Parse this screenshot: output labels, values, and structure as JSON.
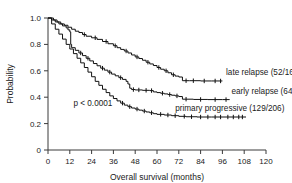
{
  "chart_data": {
    "type": "line",
    "title": "",
    "xlabel": "Overall survival (months)",
    "ylabel": "Probability",
    "xlim": [
      0,
      120
    ],
    "ylim": [
      0,
      1.0
    ],
    "xticks": [
      0,
      12,
      24,
      36,
      48,
      60,
      72,
      84,
      96,
      108,
      120
    ],
    "xtick_labels": [
      "0",
      "12",
      "24",
      "36",
      "48",
      "60",
      "72",
      "84",
      "96",
      "108",
      "120"
    ],
    "yticks": [
      0,
      0.2,
      0.4,
      0.6,
      0.8,
      1.0
    ],
    "ytick_labels": [
      "0",
      "0.2",
      "0.4",
      "0.6",
      "0.8",
      "1.0"
    ],
    "grid": false,
    "legend_position": "inline-right-of-curves",
    "annotations": [
      {
        "name": "p-value",
        "text": "p < 0.0001",
        "x": 14,
        "y": 0.33
      }
    ],
    "series": [
      {
        "name": "late relapse",
        "label": "late relapse (52/169)",
        "events": 52,
        "total": 169,
        "color": "#111111",
        "label_x": 98,
        "label_y": 0.565,
        "points": [
          [
            0,
            1.0
          ],
          [
            3,
            0.985
          ],
          [
            5,
            0.97
          ],
          [
            7,
            0.955
          ],
          [
            9,
            0.945
          ],
          [
            11,
            0.93
          ],
          [
            13,
            0.915
          ],
          [
            15,
            0.9
          ],
          [
            17,
            0.89
          ],
          [
            19,
            0.875
          ],
          [
            21,
            0.862
          ],
          [
            24,
            0.85
          ],
          [
            27,
            0.838
          ],
          [
            30,
            0.822
          ],
          [
            33,
            0.805
          ],
          [
            36,
            0.79
          ],
          [
            38,
            0.775
          ],
          [
            40,
            0.762
          ],
          [
            42,
            0.75
          ],
          [
            44,
            0.735
          ],
          [
            46,
            0.72
          ],
          [
            48,
            0.705
          ],
          [
            50,
            0.693
          ],
          [
            52,
            0.68
          ],
          [
            54,
            0.665
          ],
          [
            56,
            0.652
          ],
          [
            58,
            0.64
          ],
          [
            60,
            0.625
          ],
          [
            62,
            0.612
          ],
          [
            64,
            0.6
          ],
          [
            66,
            0.585
          ],
          [
            68,
            0.57
          ],
          [
            70,
            0.56
          ],
          [
            72,
            0.553
          ],
          [
            74,
            0.525
          ],
          [
            78,
            0.525
          ],
          [
            84,
            0.523
          ],
          [
            90,
            0.523
          ],
          [
            96,
            0.523
          ]
        ],
        "censor_times": [
          20,
          26,
          32,
          37,
          43,
          49,
          55,
          61,
          65,
          69,
          76,
          80,
          86,
          92,
          95
        ]
      },
      {
        "name": "early relapse",
        "label": "early relapse (64/138)",
        "events": 64,
        "total": 138,
        "color": "#111111",
        "label_x": 101,
        "label_y": 0.425,
        "points": [
          [
            0,
            1.0
          ],
          [
            2,
            0.985
          ],
          [
            4,
            0.97
          ],
          [
            6,
            0.955
          ],
          [
            8,
            0.94
          ],
          [
            10,
            0.925
          ],
          [
            11,
            0.91
          ],
          [
            12,
            0.895
          ],
          [
            12.5,
            0.8
          ],
          [
            13,
            0.775
          ],
          [
            15,
            0.755
          ],
          [
            17,
            0.735
          ],
          [
            19,
            0.715
          ],
          [
            21,
            0.695
          ],
          [
            23,
            0.675
          ],
          [
            25,
            0.655
          ],
          [
            27,
            0.638
          ],
          [
            29,
            0.62
          ],
          [
            31,
            0.605
          ],
          [
            33,
            0.59
          ],
          [
            35,
            0.575
          ],
          [
            37,
            0.562
          ],
          [
            39,
            0.548
          ],
          [
            41,
            0.535
          ],
          [
            43,
            0.52
          ],
          [
            44,
            0.5
          ],
          [
            45,
            0.468
          ],
          [
            46,
            0.458
          ],
          [
            48,
            0.455
          ],
          [
            52,
            0.452
          ],
          [
            56,
            0.45
          ],
          [
            58,
            0.44
          ],
          [
            60,
            0.435
          ],
          [
            62,
            0.43
          ],
          [
            64,
            0.425
          ],
          [
            66,
            0.42
          ],
          [
            68,
            0.415
          ],
          [
            70,
            0.41
          ],
          [
            72,
            0.405
          ],
          [
            74,
            0.385
          ],
          [
            80,
            0.383
          ],
          [
            88,
            0.382
          ],
          [
            96,
            0.382
          ],
          [
            100,
            0.382
          ]
        ],
        "censor_times": [
          18,
          22,
          30,
          34,
          40,
          47,
          50,
          54,
          57,
          63,
          67,
          71,
          76,
          84,
          92,
          98
        ]
      },
      {
        "name": "primary progressive",
        "label": "primary progressive (129/206)",
        "events": 129,
        "total": 206,
        "color": "#111111",
        "label_x": 70,
        "label_y": 0.295,
        "points": [
          [
            0,
            1.0
          ],
          [
            2,
            0.955
          ],
          [
            4,
            0.915
          ],
          [
            6,
            0.878
          ],
          [
            8,
            0.84
          ],
          [
            10,
            0.8
          ],
          [
            12,
            0.765
          ],
          [
            14,
            0.73
          ],
          [
            16,
            0.695
          ],
          [
            18,
            0.66
          ],
          [
            20,
            0.625
          ],
          [
            22,
            0.59
          ],
          [
            24,
            0.555
          ],
          [
            26,
            0.52
          ],
          [
            28,
            0.49
          ],
          [
            30,
            0.46
          ],
          [
            32,
            0.435
          ],
          [
            34,
            0.41
          ],
          [
            36,
            0.39
          ],
          [
            38,
            0.372
          ],
          [
            40,
            0.355
          ],
          [
            42,
            0.34
          ],
          [
            44,
            0.328
          ],
          [
            46,
            0.318
          ],
          [
            48,
            0.31
          ],
          [
            50,
            0.302
          ],
          [
            52,
            0.295
          ],
          [
            54,
            0.288
          ],
          [
            56,
            0.282
          ],
          [
            58,
            0.275
          ],
          [
            60,
            0.27
          ],
          [
            64,
            0.265
          ],
          [
            68,
            0.26
          ],
          [
            72,
            0.255
          ],
          [
            76,
            0.252
          ],
          [
            82,
            0.25
          ],
          [
            90,
            0.25
          ],
          [
            98,
            0.25
          ],
          [
            106,
            0.25
          ],
          [
            109,
            0.25
          ]
        ],
        "censor_times": [
          41,
          45,
          49,
          53,
          57,
          62,
          66,
          70,
          75,
          79,
          84,
          88,
          92,
          95,
          99,
          102,
          105,
          107
        ]
      }
    ]
  }
}
